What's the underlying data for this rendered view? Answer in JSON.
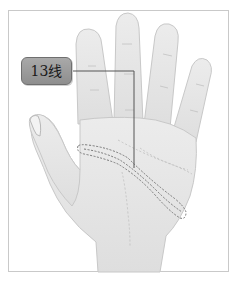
{
  "figure": {
    "label": "13线",
    "colors": {
      "skin": "#e6e6e6",
      "skin_shadow": "#d2d2d2",
      "outline": "#c4c4c4",
      "label_fill": "#9a9a9a",
      "label_border": "#6f6f6f",
      "leader_line": "#555555",
      "dashed_highlight": "#777777",
      "frame_border": "#c9c9c9"
    }
  }
}
